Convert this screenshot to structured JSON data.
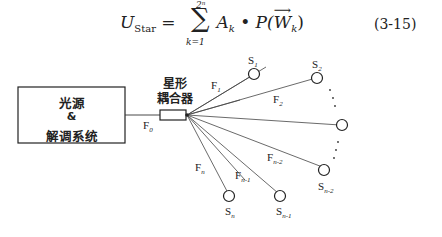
{
  "equation": {
    "lhs": "U",
    "lhs_sub": "Star",
    "sum_upper": "2ⁿ",
    "sum_lower": "k=1",
    "term": "A",
    "term_sub": "k",
    "dot": "•",
    "func": "P(",
    "vec": "W",
    "vec_sub": "k",
    "close": ")",
    "number": "(3-15)"
  },
  "diagram": {
    "box": {
      "line1": "光源",
      "line2": "&",
      "line3": "解调系统"
    },
    "coupler": {
      "line1": "星形",
      "line2": "耦合器"
    },
    "fibers": [
      {
        "name": "F",
        "sub": "0"
      },
      {
        "name": "F",
        "sub": "1"
      },
      {
        "name": "F",
        "sub": "2"
      },
      {
        "name": "F",
        "sub": "n-2"
      },
      {
        "name": "F",
        "sub": "n-1"
      },
      {
        "name": "F",
        "sub": "n"
      }
    ],
    "sensors": [
      {
        "name": "S",
        "sub": "1"
      },
      {
        "name": "S",
        "sub": "2"
      },
      {
        "name": "S",
        "sub": "n-2"
      },
      {
        "name": "S",
        "sub": "n-1"
      },
      {
        "name": "S",
        "sub": "n"
      }
    ]
  }
}
